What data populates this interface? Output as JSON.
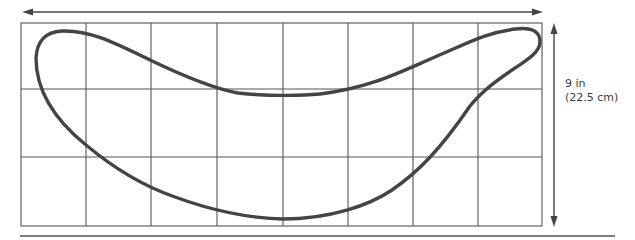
{
  "diagram": {
    "grid": {
      "columns": 8,
      "rows": 3
    },
    "dimensions": {
      "height_label": "9 in",
      "height_metric": "(22.5 cm)"
    },
    "colors": {
      "grid_line": "#555555",
      "outline": "#444444",
      "arrow": "#444444",
      "background": "#ffffff"
    }
  }
}
